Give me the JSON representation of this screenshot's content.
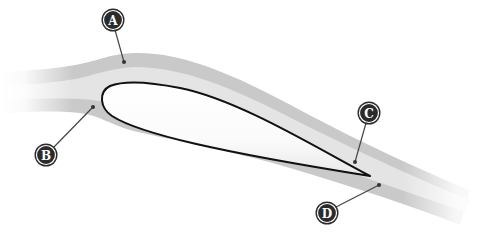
{
  "diagram": {
    "colors": {
      "background": "#ffffff",
      "band_outer": "#c9c9c9",
      "band_inner": "#e4e4e4",
      "airfoil_fill": "#ffffff",
      "airfoil_stroke": "#111111",
      "label_fill": "#2b2b2b",
      "label_text": "#ffffff",
      "leader_line": "#444444"
    },
    "labels": [
      {
        "id": "A",
        "text": "A",
        "cx": 113,
        "cy": 20,
        "tx": 124,
        "ty": 62
      },
      {
        "id": "B",
        "text": "B",
        "cx": 46,
        "cy": 155,
        "tx": 93,
        "ty": 107
      },
      {
        "id": "C",
        "text": "C",
        "cx": 369,
        "cy": 113,
        "tx": 355,
        "ty": 162
      },
      {
        "id": "D",
        "text": "D",
        "cx": 327,
        "cy": 213,
        "tx": 379,
        "ty": 185
      }
    ]
  }
}
